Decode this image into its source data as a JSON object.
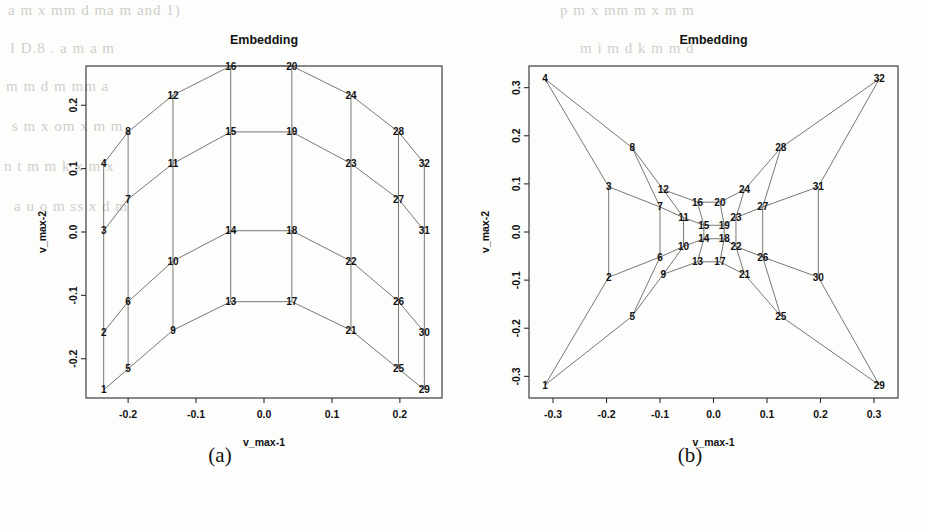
{
  "figure": {
    "panels": [
      {
        "id": "a",
        "caption": "(a)",
        "title": "Embedding",
        "xlabel": "v_max-1",
        "ylabel": "v_max-2"
      },
      {
        "id": "b",
        "caption": "(b)",
        "title": "Embedding",
        "xlabel": "v_max-1",
        "ylabel": "v_max-2"
      }
    ]
  },
  "background_text": [
    "a m x  mm  d   ma  m and 1)",
    "I  D.8  .   a   m    a    m",
    "m   m d   m  mm   a",
    "s  m  x  om   x   m   m",
    "n    t  m  m  k  x    m   x",
    "a   u  o   m   ss  x   d   m",
    "p   m  x   mm   m   x  m  m",
    "m  i   m d   k    m  m   d"
  ],
  "chart_data": [
    {
      "type": "scatter",
      "panel": "a",
      "title": "Embedding",
      "xlabel": "v_max-1",
      "ylabel": "v_max-2",
      "xlim": [
        -0.262,
        0.262
      ],
      "ylim": [
        -0.262,
        0.262
      ],
      "xticks": [
        -0.2,
        -0.1,
        0.0,
        0.1,
        0.2
      ],
      "xtick_labels": [
        "-0.2",
        "-0.1",
        "0.0",
        "0.1",
        "0.2"
      ],
      "yticks": [
        -0.2,
        -0.1,
        0.0,
        0.1,
        0.2
      ],
      "ytick_labels": [
        "-0.2",
        "-0.1",
        "0.0",
        "0.1",
        "0.2"
      ],
      "grid": false,
      "legend": "none",
      "point_labels": [
        "1",
        "2",
        "3",
        "4",
        "5",
        "6",
        "7",
        "8",
        "9",
        "10",
        "11",
        "12",
        "13",
        "14",
        "15",
        "16",
        "17",
        "18",
        "19",
        "20",
        "21",
        "22",
        "23",
        "24",
        "25",
        "26",
        "27",
        "28",
        "29",
        "30",
        "31",
        "32"
      ],
      "x": [
        -0.236,
        -0.236,
        -0.236,
        -0.236,
        -0.2,
        -0.2,
        -0.2,
        -0.2,
        -0.134,
        -0.134,
        -0.134,
        -0.134,
        -0.049,
        -0.049,
        -0.049,
        -0.049,
        0.041,
        0.041,
        0.041,
        0.041,
        0.128,
        0.128,
        0.128,
        0.128,
        0.198,
        0.198,
        0.198,
        0.198,
        0.236,
        0.236,
        0.236,
        0.236
      ],
      "y": [
        -0.249,
        -0.158,
        0.002,
        0.108,
        -0.216,
        -0.11,
        0.052,
        0.158,
        -0.155,
        -0.046,
        0.108,
        0.216,
        -0.11,
        0.002,
        0.158,
        0.262,
        -0.11,
        0.002,
        0.158,
        0.262,
        -0.155,
        -0.046,
        0.108,
        0.216,
        -0.216,
        -0.11,
        0.052,
        0.158,
        -0.249,
        -0.158,
        0.002,
        0.108
      ],
      "edges": [
        [
          1,
          2
        ],
        [
          2,
          3
        ],
        [
          3,
          4
        ],
        [
          5,
          6
        ],
        [
          6,
          7
        ],
        [
          7,
          8
        ],
        [
          9,
          10
        ],
        [
          10,
          11
        ],
        [
          11,
          12
        ],
        [
          13,
          14
        ],
        [
          14,
          15
        ],
        [
          15,
          16
        ],
        [
          17,
          18
        ],
        [
          18,
          19
        ],
        [
          19,
          20
        ],
        [
          21,
          22
        ],
        [
          22,
          23
        ],
        [
          23,
          24
        ],
        [
          25,
          26
        ],
        [
          26,
          27
        ],
        [
          27,
          28
        ],
        [
          29,
          30
        ],
        [
          30,
          31
        ],
        [
          31,
          32
        ],
        [
          1,
          5
        ],
        [
          5,
          9
        ],
        [
          9,
          13
        ],
        [
          13,
          17
        ],
        [
          17,
          21
        ],
        [
          21,
          25
        ],
        [
          25,
          29
        ],
        [
          2,
          6
        ],
        [
          6,
          10
        ],
        [
          10,
          14
        ],
        [
          14,
          18
        ],
        [
          18,
          22
        ],
        [
          22,
          26
        ],
        [
          26,
          30
        ],
        [
          3,
          7
        ],
        [
          7,
          11
        ],
        [
          11,
          15
        ],
        [
          15,
          19
        ],
        [
          19,
          23
        ],
        [
          23,
          27
        ],
        [
          27,
          31
        ],
        [
          4,
          8
        ],
        [
          8,
          12
        ],
        [
          12,
          16
        ],
        [
          16,
          20
        ],
        [
          20,
          24
        ],
        [
          24,
          28
        ],
        [
          28,
          32
        ]
      ]
    },
    {
      "type": "scatter",
      "panel": "b",
      "title": "Embedding",
      "xlabel": "v_max-1",
      "ylabel": "v_max-2",
      "xlim": [
        -0.345,
        0.345
      ],
      "ylim": [
        -0.345,
        0.345
      ],
      "xticks": [
        -0.3,
        -0.2,
        -0.1,
        0.0,
        0.1,
        0.2,
        0.3
      ],
      "xtick_labels": [
        "-0.3",
        "-0.2",
        "-0.1",
        "0.0",
        "0.1",
        "0.2",
        "0.3"
      ],
      "yticks": [
        -0.3,
        -0.2,
        -0.1,
        0.0,
        0.1,
        0.2,
        0.3
      ],
      "ytick_labels": [
        "-0.3",
        "-0.2",
        "-0.1",
        "0.0",
        "0.1",
        "0.2",
        "0.3"
      ],
      "grid": false,
      "legend": "none",
      "point_labels": [
        "1",
        "2",
        "3",
        "4",
        "5",
        "6",
        "7",
        "8",
        "9",
        "10",
        "11",
        "12",
        "13",
        "14",
        "15",
        "16",
        "17",
        "18",
        "19",
        "20",
        "21",
        "22",
        "23",
        "24",
        "25",
        "26",
        "27",
        "28",
        "29",
        "30",
        "31",
        "32"
      ],
      "x": [
        -0.315,
        -0.196,
        -0.196,
        -0.315,
        -0.152,
        -0.1,
        -0.1,
        -0.152,
        -0.094,
        -0.056,
        -0.056,
        -0.094,
        -0.03,
        -0.018,
        -0.018,
        -0.03,
        0.012,
        0.02,
        0.02,
        0.012,
        0.058,
        0.042,
        0.042,
        0.058,
        0.126,
        0.092,
        0.092,
        0.126,
        0.31,
        0.196,
        0.196,
        0.31
      ],
      "y": [
        -0.318,
        -0.094,
        0.094,
        0.318,
        -0.175,
        -0.052,
        0.052,
        0.175,
        -0.088,
        -0.03,
        0.03,
        0.088,
        -0.062,
        -0.014,
        0.014,
        0.062,
        -0.062,
        -0.014,
        0.014,
        0.062,
        -0.088,
        -0.03,
        0.03,
        0.088,
        -0.175,
        -0.052,
        0.052,
        0.175,
        -0.318,
        -0.094,
        0.094,
        0.318
      ],
      "edges": [
        [
          1,
          2
        ],
        [
          2,
          3
        ],
        [
          3,
          4
        ],
        [
          5,
          6
        ],
        [
          6,
          7
        ],
        [
          7,
          8
        ],
        [
          9,
          10
        ],
        [
          10,
          11
        ],
        [
          11,
          12
        ],
        [
          13,
          14
        ],
        [
          14,
          15
        ],
        [
          15,
          16
        ],
        [
          17,
          18
        ],
        [
          18,
          19
        ],
        [
          19,
          20
        ],
        [
          21,
          22
        ],
        [
          22,
          23
        ],
        [
          23,
          24
        ],
        [
          25,
          26
        ],
        [
          26,
          27
        ],
        [
          27,
          28
        ],
        [
          29,
          30
        ],
        [
          30,
          31
        ],
        [
          31,
          32
        ],
        [
          1,
          5
        ],
        [
          5,
          9
        ],
        [
          9,
          13
        ],
        [
          13,
          17
        ],
        [
          17,
          21
        ],
        [
          21,
          25
        ],
        [
          25,
          29
        ],
        [
          2,
          6
        ],
        [
          6,
          10
        ],
        [
          10,
          14
        ],
        [
          14,
          18
        ],
        [
          18,
          22
        ],
        [
          22,
          26
        ],
        [
          26,
          30
        ],
        [
          3,
          7
        ],
        [
          7,
          11
        ],
        [
          11,
          15
        ],
        [
          15,
          19
        ],
        [
          19,
          23
        ],
        [
          23,
          27
        ],
        [
          27,
          31
        ],
        [
          4,
          8
        ],
        [
          8,
          12
        ],
        [
          12,
          16
        ],
        [
          16,
          20
        ],
        [
          20,
          24
        ],
        [
          24,
          28
        ],
        [
          28,
          32
        ]
      ]
    }
  ],
  "style": {
    "line_color": "#555555",
    "frame_color": "#2b2b2b",
    "text_color": "#111111"
  }
}
